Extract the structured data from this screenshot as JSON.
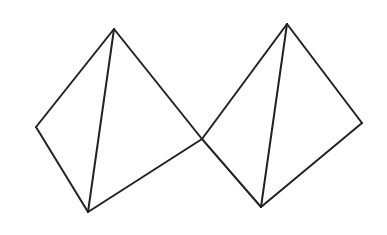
{
  "diagram": {
    "title": "",
    "stroke_color": "#222222",
    "background": "#ffffff",
    "shapes": [
      {
        "name": "left-tetrahedron",
        "vertices": {
          "top": [
            114,
            29
          ],
          "left": [
            36,
            127
          ],
          "bottom": [
            88,
            212
          ],
          "right": [
            202,
            139
          ]
        },
        "edges": [
          [
            "top",
            "left"
          ],
          [
            "left",
            "bottom"
          ],
          [
            "bottom",
            "right"
          ],
          [
            "right",
            "top"
          ],
          [
            "top",
            "bottom"
          ]
        ]
      },
      {
        "name": "right-tetrahedron",
        "vertices": {
          "top": [
            287,
            24
          ],
          "left": [
            202,
            139
          ],
          "bottom": [
            261,
            207
          ],
          "right": [
            362,
            123
          ]
        },
        "edges": [
          [
            "top",
            "left"
          ],
          [
            "left",
            "bottom"
          ],
          [
            "bottom",
            "right"
          ],
          [
            "right",
            "top"
          ],
          [
            "top",
            "bottom"
          ]
        ]
      }
    ],
    "shared_vertex": [
      202,
      139
    ]
  }
}
